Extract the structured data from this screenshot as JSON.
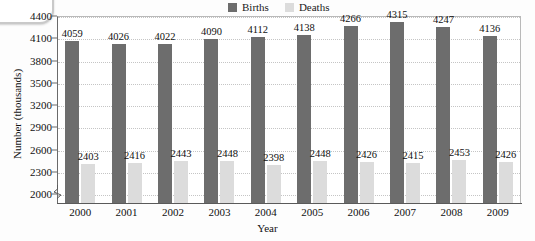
{
  "chart_data": {
    "type": "bar",
    "title": "",
    "xlabel": "Year",
    "ylabel": "Number (thousands)",
    "categories": [
      "2000",
      "2001",
      "2002",
      "2003",
      "2004",
      "2005",
      "2006",
      "2007",
      "2008",
      "2009"
    ],
    "series": [
      {
        "name": "Births",
        "color": "#6d6d6d",
        "values": [
          4059,
          4026,
          4022,
          4090,
          4112,
          4138,
          4266,
          4315,
          4247,
          4136
        ]
      },
      {
        "name": "Deaths",
        "color": "#dcdcdc",
        "values": [
          2403,
          2416,
          2443,
          2448,
          2398,
          2448,
          2426,
          2415,
          2453,
          2426
        ]
      }
    ],
    "yticks": [
      2000,
      2300,
      2600,
      2900,
      3200,
      3500,
      3800,
      4100,
      4400
    ],
    "ylim": [
      1880,
      4400
    ],
    "ytick_step": 300,
    "grid": true,
    "grid_axis": "y",
    "legend_position": "top-center",
    "axis_break": true,
    "data_labels": true
  },
  "legend": {
    "items": [
      {
        "label": "Births",
        "color": "#6d6d6d"
      },
      {
        "label": "Deaths",
        "color": "#dcdcdc"
      }
    ]
  },
  "axes": {
    "x_title": "Year",
    "y_title": "Number (thousands)"
  }
}
